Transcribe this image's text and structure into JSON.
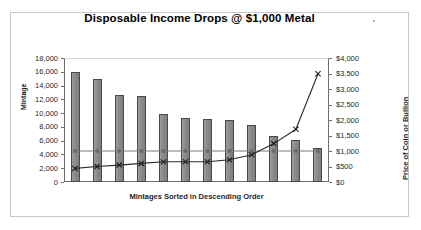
{
  "chart_data": {
    "type": "bar",
    "title": "Disposable Income Drops @ $1,000 Metal",
    "xlabel": "Mintages Sorted in Descending Order",
    "ylabel": "Mintage",
    "y2label": "Price of Coin or Bullion",
    "categories": [
      "1",
      "2",
      "3",
      "4",
      "5",
      "6",
      "7",
      "8",
      "9",
      "10",
      "11",
      "12"
    ],
    "values": [
      15950,
      15000,
      12600,
      12450,
      9900,
      9350,
      9200,
      9050,
      8300,
      6650,
      6100,
      4900
    ],
    "ylim": [
      0,
      18000
    ],
    "yticks": [
      "0",
      "2,000",
      "4,000",
      "6,000",
      "8,000",
      "10,000",
      "12,000",
      "14,000",
      "16,000",
      "18,000"
    ],
    "ytick_values": [
      0,
      2000,
      4000,
      6000,
      8000,
      10000,
      12000,
      14000,
      16000,
      18000
    ],
    "y2lim": [
      0,
      4000
    ],
    "y2ticks": [
      "$0",
      "$500",
      "$1,000",
      "$1,500",
      "$2,000",
      "$2,500",
      "$3,000",
      "$3,500",
      "$4,000"
    ],
    "y2tick_values": [
      0,
      500,
      1000,
      1500,
      2000,
      2500,
      3000,
      3500,
      4000
    ],
    "grid": false,
    "legend": "none",
    "series": [
      {
        "name": "Bullion Price",
        "axis": "right",
        "marker": "square",
        "values": [
          1000,
          1000,
          1000,
          1000,
          1000,
          1000,
          1000,
          1000,
          1000,
          1000,
          1000,
          1000
        ]
      },
      {
        "name": "Coin Price",
        "axis": "right",
        "marker": "x",
        "values": [
          440,
          500,
          545,
          600,
          650,
          655,
          655,
          720,
          880,
          1240,
          1700,
          3490
        ]
      }
    ],
    "colors": {
      "bar_fill": "#8c8c8c",
      "bar_edge": "#4a4a4a",
      "line_flat": "#7b7b7b",
      "line_rising": "#2b2b2b",
      "axis": "#6d6d6d",
      "frame": "#c8c8c8"
    }
  }
}
